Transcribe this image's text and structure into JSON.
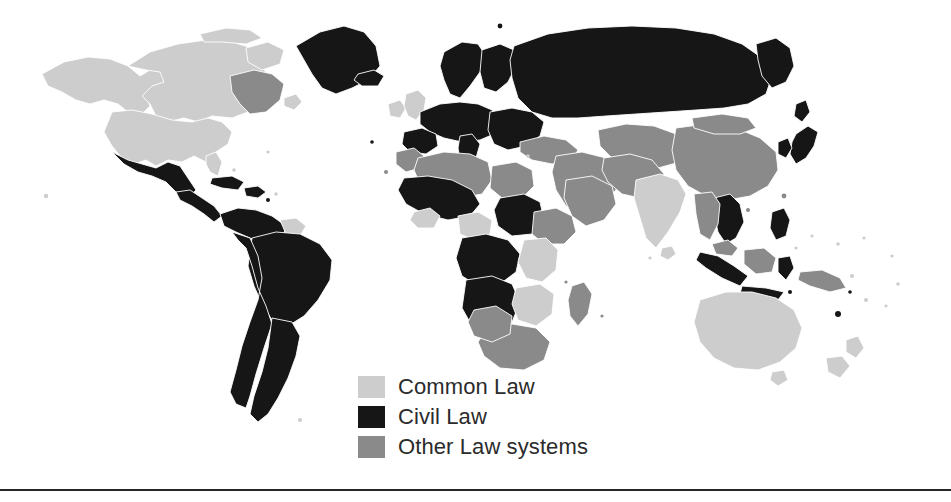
{
  "figure": {
    "background_color": "#ffffff",
    "width": 951,
    "height": 502
  },
  "legend": {
    "position": "bottom-center-left",
    "items": [
      {
        "label": "Common Law",
        "color": "#cdcdcd",
        "swatch_name": "common-law-swatch"
      },
      {
        "label": "Civil Law",
        "color": "#161616",
        "swatch_name": "civil-law-swatch"
      },
      {
        "label": "Other Law systems",
        "color": "#8a8a8a",
        "swatch_name": "other-law-swatch"
      }
    ]
  },
  "palette": {
    "common_law": "#cdcdcd",
    "civil_law": "#161616",
    "other_law": "#8a8a8a",
    "ocean": "#ffffff",
    "rule": "#262626"
  },
  "divider": {
    "name": "bottom-horizontal-rule",
    "color": "#262626"
  },
  "map_regions": [
    {
      "name": "alaska",
      "category": "common_law",
      "path": "M42,74 L64,62 L88,57 L110,59 L128,66 L140,76 L150,70 L162,72 L168,82 L158,92 L146,96 L150,106 L142,114 L128,112 L118,104 L104,100 L90,104 L76,100 L62,92 L48,86 Z"
    },
    {
      "name": "canada",
      "category": "common_law",
      "path": "M128,66 L150,52 L178,44 L206,40 L232,42 L252,48 L268,44 L282,48 L276,60 L262,66 L268,76 L258,86 L246,84 L240,94 L252,100 L248,112 L232,118 L212,116 L198,122 L184,118 L168,122 L156,116 L150,104 L142,96 L152,86 L164,82 L160,72 L146,70 Z"
    },
    {
      "name": "canada-arctic-islands",
      "category": "common_law",
      "path": "M200,34 L226,28 L250,30 L262,38 L246,44 L222,42 L204,42 Z"
    },
    {
      "name": "baffin-island",
      "category": "common_law",
      "path": "M246,48 L268,42 L284,50 L280,64 L262,70 L248,62 Z"
    },
    {
      "name": "quebec-labrador",
      "category": "other_law",
      "path": "M230,76 L254,70 L272,74 L284,84 L280,100 L266,112 L250,114 L240,104 L232,92 Z"
    },
    {
      "name": "newfoundland",
      "category": "common_law",
      "path": "M284,98 L296,94 L302,102 L294,110 L284,106 Z"
    },
    {
      "name": "united-states",
      "category": "common_law",
      "path": "M112,112 L132,110 L152,114 L172,120 L192,122 L208,118 L222,122 L232,132 L228,144 L216,152 L206,162 L194,156 L182,162 L168,160 L156,166 L146,160 L134,164 L122,158 L112,146 L104,132 Z"
    },
    {
      "name": "us-southeast-florida",
      "category": "common_law",
      "path": "M206,156 L216,152 L222,162 L218,176 L210,172 L206,164 Z"
    },
    {
      "name": "mexico",
      "category": "civil_law",
      "path": "M112,152 L128,160 L142,164 L156,168 L168,162 L180,166 L188,178 L196,190 L188,198 L176,192 L166,182 L152,176 L138,172 L124,164 Z"
    },
    {
      "name": "central-america",
      "category": "civil_law",
      "path": "M176,192 L190,190 L202,198 L214,206 L222,216 L214,222 L204,214 L192,206 L180,200 Z"
    },
    {
      "name": "cuba",
      "category": "civil_law",
      "path": "M212,178 L232,176 L244,182 L238,190 L222,188 L210,184 Z"
    },
    {
      "name": "hispaniola-caribbean",
      "category": "civil_law",
      "path": "M244,188 L258,186 L266,192 L258,198 L246,196 Z"
    },
    {
      "name": "colombia-venezuela",
      "category": "civil_law",
      "path": "M220,214 L238,208 L256,210 L272,216 L286,226 L282,240 L266,244 L250,238 L236,232 L224,226 Z"
    },
    {
      "name": "guyana-suriname",
      "category": "common_law",
      "path": "M280,220 L296,218 L306,226 L300,236 L286,234 Z"
    },
    {
      "name": "brazil",
      "category": "civil_law",
      "path": "M252,238 L276,232 L300,234 L320,244 L332,260 L330,280 L318,300 L304,316 L288,326 L272,320 L262,304 L254,286 L248,266 Z"
    },
    {
      "name": "peru-bolivia-chile",
      "category": "civil_law",
      "path": "M232,232 L250,238 L258,256 L262,278 L258,300 L250,322 L242,346 L236,370 L230,392 L236,404 L246,408 L250,396 L256,374 L264,348 L272,324 L266,306 L258,288 L252,266 L246,248 L238,240 Z"
    },
    {
      "name": "argentina-uruguay",
      "category": "civil_law",
      "path": "M272,318 L292,322 L300,336 L296,356 L288,378 L278,398 L268,414 L258,422 L250,414 L254,396 L262,372 L268,348 Z"
    },
    {
      "name": "greenland",
      "category": "civil_law",
      "path": "M296,46 L320,32 L344,26 L364,32 L376,46 L380,66 L368,80 L352,88 L336,94 L322,88 L312,74 L304,60 Z"
    },
    {
      "name": "iceland",
      "category": "civil_law",
      "path": "M358,74 L374,70 L384,76 L378,86 L362,86 L354,80 Z"
    },
    {
      "name": "ireland",
      "category": "common_law",
      "path": "M388,104 L400,100 L406,108 L400,118 L390,116 Z"
    },
    {
      "name": "united-kingdom",
      "category": "common_law",
      "path": "M406,94 L418,90 L426,98 L424,110 L416,120 L408,116 L404,106 Z"
    },
    {
      "name": "scandinavia",
      "category": "civil_law",
      "path": "M444,52 L462,42 L478,44 L486,56 L480,72 L470,86 L460,98 L450,94 L444,80 L440,66 Z"
    },
    {
      "name": "finland-baltics",
      "category": "civil_law",
      "path": "M482,50 L500,44 L514,50 L516,66 L508,82 L496,92 L484,88 L480,72 Z"
    },
    {
      "name": "western-europe",
      "category": "civil_law",
      "path": "M420,112 L440,104 L460,102 L478,104 L492,110 L500,122 L494,134 L480,140 L462,142 L444,138 L430,132 L420,124 Z"
    },
    {
      "name": "iberia",
      "category": "civil_law",
      "path": "M404,132 L422,128 L436,134 L438,146 L426,154 L410,152 L402,144 Z"
    },
    {
      "name": "italy",
      "category": "civil_law",
      "path": "M460,136 L472,134 L480,144 L476,158 L468,166 L460,160 L458,148 Z"
    },
    {
      "name": "eastern-europe-balkans",
      "category": "civil_law",
      "path": "M490,112 L512,108 L532,112 L544,122 L540,136 L526,146 L508,150 L494,144 L488,130 Z"
    },
    {
      "name": "russia",
      "category": "civil_law",
      "path": "M514,46 L548,34 L588,28 L632,26 L676,28 L714,34 L742,44 L762,58 L772,76 L766,94 L748,104 L724,108 L696,110 L666,112 L636,114 L606,116 L578,118 L552,118 L532,112 L518,98 L512,78 L510,60 Z"
    },
    {
      "name": "kamchatka-far-east",
      "category": "civil_law",
      "path": "M756,44 L776,38 L790,48 L794,66 L786,82 L772,88 L762,76 L758,60 Z"
    },
    {
      "name": "turkey-caucasus",
      "category": "other_law",
      "path": "M520,142 L544,136 L566,140 L578,150 L572,160 L552,164 L532,160 L520,152 Z"
    },
    {
      "name": "middle-east",
      "category": "other_law",
      "path": "M556,156 L582,152 L606,158 L620,172 L616,190 L600,204 L582,212 L566,206 L556,190 L552,172 Z"
    },
    {
      "name": "saudi-arabia",
      "category": "other_law",
      "path": "M566,180 L592,176 L612,186 L616,204 L604,220 L586,226 L572,216 L564,198 Z"
    },
    {
      "name": "central-asia",
      "category": "other_law",
      "path": "M598,130 L626,124 L654,126 L676,134 L688,148 L680,162 L658,168 L634,166 L612,158 L600,146 Z"
    },
    {
      "name": "iran-afghanistan-pakistan",
      "category": "other_law",
      "path": "M604,158 L630,154 L652,160 L664,174 L658,190 L640,198 L622,194 L608,182 L602,170 Z"
    },
    {
      "name": "india",
      "category": "common_law",
      "path": "M636,180 L660,174 L678,180 L686,194 L680,212 L668,232 L656,248 L646,238 L640,218 L634,198 Z"
    },
    {
      "name": "sri-lanka",
      "category": "common_law",
      "path": "M662,248 L672,246 L676,254 L668,260 L660,256 Z"
    },
    {
      "name": "china",
      "category": "other_law",
      "path": "M676,128 L706,124 L736,128 L760,138 L776,152 L778,170 L768,186 L750,196 L728,200 L706,196 L688,186 L676,170 L672,150 Z"
    },
    {
      "name": "mongolia",
      "category": "other_law",
      "path": "M692,118 L722,114 L748,118 L756,128 L740,134 L714,134 L694,128 Z"
    },
    {
      "name": "japan",
      "category": "civil_law",
      "path": "M796,134 L808,126 L818,132 L814,146 L806,158 L796,164 L790,154 L792,142 Z"
    },
    {
      "name": "korea",
      "category": "civil_law",
      "path": "M778,142 L788,138 L792,148 L786,158 L778,154 Z"
    },
    {
      "name": "sakhalin",
      "category": "civil_law",
      "path": "M796,104 L806,100 L810,112 L802,122 L794,116 Z"
    },
    {
      "name": "indochina-vietnam-laos",
      "category": "civil_law",
      "path": "M714,198 L730,194 L740,204 L744,222 L736,238 L726,244 L718,232 L714,214 Z"
    },
    {
      "name": "thailand-myanmar",
      "category": "other_law",
      "path": "M694,194 L712,192 L720,204 L718,224 L710,240 L700,234 L696,214 Z"
    },
    {
      "name": "malaysia",
      "category": "other_law",
      "path": "M712,244 L728,240 L738,248 L732,256 L716,254 Z"
    },
    {
      "name": "indonesia-sumatra",
      "category": "civil_law",
      "path": "M700,252 L718,256 L734,266 L748,276 L740,286 L722,278 L706,268 L696,260 Z"
    },
    {
      "name": "indonesia-java",
      "category": "civil_law",
      "path": "M742,286 L766,288 L784,292 L778,300 L756,298 L740,294 Z"
    },
    {
      "name": "borneo",
      "category": "other_law",
      "path": "M744,250 L764,248 L776,258 L772,272 L756,274 L744,264 Z"
    },
    {
      "name": "sulawesi",
      "category": "civil_law",
      "path": "M778,258 L790,256 L794,268 L786,280 L778,272 Z"
    },
    {
      "name": "philippines",
      "category": "civil_law",
      "path": "M772,212 L784,208 L790,220 L786,236 L776,240 L770,228 Z"
    },
    {
      "name": "new-guinea",
      "category": "other_law",
      "path": "M800,272 L822,270 L840,278 L846,288 L830,292 L810,286 L798,280 Z"
    },
    {
      "name": "australia",
      "category": "common_law",
      "path": "M700,300 L726,292 L752,292 L776,298 L794,310 L802,328 L796,348 L780,362 L758,370 L734,368 L714,358 L700,342 L694,322 Z"
    },
    {
      "name": "tasmania",
      "category": "common_law",
      "path": "M772,372 L784,370 L788,380 L778,386 L770,380 Z"
    },
    {
      "name": "new-zealand-north",
      "category": "common_law",
      "path": "M846,340 L858,336 L864,348 L856,358 L846,352 Z"
    },
    {
      "name": "new-zealand-south",
      "category": "common_law",
      "path": "M826,358 L842,356 L850,366 L840,378 L828,372 Z"
    },
    {
      "name": "morocco",
      "category": "other_law",
      "path": "M396,152 L414,148 L424,156 L420,168 L406,172 L396,164 Z"
    },
    {
      "name": "algeria-libya",
      "category": "other_law",
      "path": "M418,158 L444,152 L470,154 L488,162 L492,180 L482,194 L460,198 L436,194 L420,184 L414,170 Z"
    },
    {
      "name": "egypt",
      "category": "other_law",
      "path": "M492,166 L516,162 L532,170 L534,186 L522,198 L502,198 L490,188 Z"
    },
    {
      "name": "sudan",
      "category": "civil_law",
      "path": "M500,198 L524,194 L540,202 L544,220 L532,234 L512,236 L498,226 L494,210 Z"
    },
    {
      "name": "west-africa-sahel",
      "category": "civil_law",
      "path": "M404,178 L428,176 L452,180 L472,190 L480,204 L470,216 L448,220 L424,214 L406,204 L398,190 Z"
    },
    {
      "name": "nigeria",
      "category": "common_law",
      "path": "M458,216 L478,212 L492,220 L490,234 L474,240 L460,234 Z"
    },
    {
      "name": "ghana-sierra-leone",
      "category": "common_law",
      "path": "M414,212 L430,208 L440,216 L434,228 L418,228 L410,220 Z"
    },
    {
      "name": "central-africa",
      "category": "civil_law",
      "path": "M462,238 L486,234 L508,240 L520,254 L516,272 L500,284 L478,286 L462,276 L456,258 Z"
    },
    {
      "name": "ethiopia-horn",
      "category": "other_law",
      "path": "M534,212 L556,208 L572,216 L576,232 L564,244 L544,244 L532,234 Z"
    },
    {
      "name": "kenya-tanzania",
      "category": "common_law",
      "path": "M524,240 L546,238 L558,250 L556,270 L542,282 L526,278 L518,262 Z"
    },
    {
      "name": "dr-congo-angola",
      "category": "civil_law",
      "path": "M466,280 L492,276 L512,284 L520,302 L512,322 L492,332 L472,326 L462,308 Z"
    },
    {
      "name": "zambia-zimbabwe",
      "category": "common_law",
      "path": "M516,288 L540,284 L554,294 L552,314 L536,326 L518,320 L512,304 Z"
    },
    {
      "name": "madagascar",
      "category": "other_law",
      "path": "M572,286 L584,282 L592,294 L588,314 L578,326 L570,316 L568,300 Z"
    },
    {
      "name": "south-africa",
      "category": "other_law",
      "path": "M486,330 L512,324 L536,328 L550,342 L544,360 L524,370 L500,368 L484,356 L478,342 Z"
    },
    {
      "name": "namibia-botswana",
      "category": "other_law",
      "path": "M474,310 L496,306 L512,316 L510,334 L492,342 L474,336 L468,322 Z"
    }
  ],
  "map_dots": [
    {
      "name": "hawaii-dot",
      "category": "common_law",
      "cx": 46,
      "cy": 196,
      "r": 2.2
    },
    {
      "name": "caribbean-dot-1",
      "category": "civil_law",
      "cx": 268,
      "cy": 200,
      "r": 2.0
    },
    {
      "name": "caribbean-dot-2",
      "category": "common_law",
      "cx": 276,
      "cy": 194,
      "r": 1.8
    },
    {
      "name": "azores-dot",
      "category": "civil_law",
      "cx": 372,
      "cy": 142,
      "r": 1.8
    },
    {
      "name": "canary-dot",
      "category": "other_law",
      "cx": 386,
      "cy": 172,
      "r": 2.0
    },
    {
      "name": "cyprus-dot",
      "category": "common_law",
      "cx": 528,
      "cy": 156,
      "r": 1.8
    },
    {
      "name": "maldives-dot",
      "category": "common_law",
      "cx": 650,
      "cy": 258,
      "r": 1.6
    },
    {
      "name": "fiji-dot",
      "category": "common_law",
      "cx": 866,
      "cy": 300,
      "r": 2.0
    },
    {
      "name": "vanuatu-dot",
      "category": "civil_law",
      "cx": 850,
      "cy": 292,
      "r": 1.8
    },
    {
      "name": "new-caledonia-dot",
      "category": "civil_law",
      "cx": 838,
      "cy": 314,
      "r": 3.0
    },
    {
      "name": "solomon-dot",
      "category": "common_law",
      "cx": 852,
      "cy": 276,
      "r": 2.0
    },
    {
      "name": "samoa-dot",
      "category": "common_law",
      "cx": 898,
      "cy": 284,
      "r": 1.8
    },
    {
      "name": "tonga-dot",
      "category": "common_law",
      "cx": 886,
      "cy": 306,
      "r": 1.6
    },
    {
      "name": "micronesia-dot",
      "category": "common_law",
      "cx": 838,
      "cy": 244,
      "r": 1.8
    },
    {
      "name": "guam-dot",
      "category": "common_law",
      "cx": 812,
      "cy": 236,
      "r": 1.6
    },
    {
      "name": "palau-dot",
      "category": "common_law",
      "cx": 796,
      "cy": 248,
      "r": 1.6
    },
    {
      "name": "marshall-dot",
      "category": "common_law",
      "cx": 864,
      "cy": 238,
      "r": 1.6
    },
    {
      "name": "kiribati-dot",
      "category": "common_law",
      "cx": 892,
      "cy": 256,
      "r": 1.6
    },
    {
      "name": "falklands-dot",
      "category": "common_law",
      "cx": 300,
      "cy": 420,
      "r": 2.0
    },
    {
      "name": "mauritius-dot",
      "category": "other_law",
      "cx": 602,
      "cy": 316,
      "r": 1.6
    },
    {
      "name": "comoros-dot",
      "category": "other_law",
      "cx": 566,
      "cy": 282,
      "r": 1.6
    },
    {
      "name": "bahamas-dot",
      "category": "common_law",
      "cx": 234,
      "cy": 170,
      "r": 1.8
    },
    {
      "name": "bermuda-dot",
      "category": "common_law",
      "cx": 268,
      "cy": 152,
      "r": 1.6
    },
    {
      "name": "svalbard-dot",
      "category": "civil_law",
      "cx": 500,
      "cy": 26,
      "r": 2.4
    },
    {
      "name": "taiwan-dot",
      "category": "other_law",
      "cx": 784,
      "cy": 196,
      "r": 2.4
    },
    {
      "name": "hainan-dot",
      "category": "other_law",
      "cx": 748,
      "cy": 210,
      "r": 2.0
    },
    {
      "name": "timor-dot",
      "category": "civil_law",
      "cx": 790,
      "cy": 292,
      "r": 2.0
    }
  ]
}
